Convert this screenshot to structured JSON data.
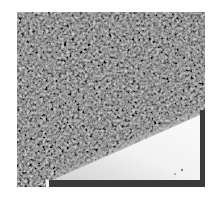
{
  "image": {
    "description": "Grayscale granular/noisy texture with a bright triangular wedge region in the lower right",
    "colors": {
      "background": "#ffffff",
      "dark_texture": "#2a2a2a",
      "bright_wedge": "#f4f4f4",
      "border": "#3a3a3a"
    },
    "frame": {
      "x": 17,
      "y": 12,
      "width": 188,
      "height": 175
    },
    "wedge_points": "31,170 183,103 183,168 31,170",
    "tick_marker": {
      "x": 29,
      "y": 168,
      "width": 3,
      "height": 7
    }
  }
}
